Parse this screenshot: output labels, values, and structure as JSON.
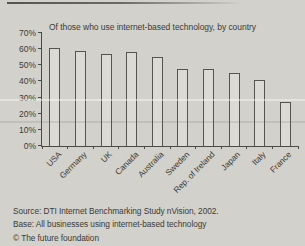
{
  "page": {
    "background": "#d2d1cb",
    "text_color": "#3c3b37"
  },
  "chart_data": {
    "type": "bar",
    "title": "Of those who use internet-based technology, by country",
    "categories": [
      "USA",
      "Germany",
      "UK",
      "Canada",
      "Australia",
      "Sweden",
      "Rep. of Ireland",
      "Japan",
      "Italy",
      "France"
    ],
    "values": [
      61,
      59,
      57,
      58,
      55,
      48,
      48,
      45,
      41,
      27
    ],
    "xlabel": "",
    "ylabel": "",
    "ylim": [
      0,
      70
    ],
    "ytick_step": 10,
    "ytick_suffix": "%",
    "grid": false,
    "legend": "none",
    "bar_fill": "#dbdad4",
    "bar_border": "#55544e",
    "axis_color": "#4a4944"
  },
  "footer": {
    "source": "Source: DTI Internet Benchmarking Study nVision, 2002.",
    "base": "Base: All businesses using internet-based technology",
    "copyright": "© The future foundation"
  }
}
